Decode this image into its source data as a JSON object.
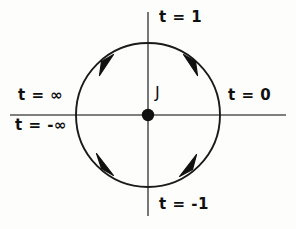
{
  "diagram": {
    "background_color": "#fdfdfc",
    "stroke_color": "#1a1a1a",
    "axis_color": "#555555",
    "center": {
      "x": 148,
      "y": 115
    },
    "radius": 72,
    "origin_label": "J",
    "labels": {
      "top": "t = 1",
      "bottom": "t = -1",
      "right": "t = 0",
      "left_upper": "t = ∞",
      "left_lower": "t = -∞"
    },
    "arrows": [
      {
        "name": "upper-left-arrow",
        "position": "upper-left",
        "direction": "toward-top"
      },
      {
        "name": "upper-right-arrow",
        "position": "upper-right",
        "direction": "toward-top"
      },
      {
        "name": "lower-left-arrow",
        "position": "lower-left",
        "direction": "toward-left"
      },
      {
        "name": "lower-right-arrow",
        "position": "lower-right",
        "direction": "toward-bottom"
      }
    ],
    "axes": {
      "horizontal": {
        "x1": 10,
        "x2": 286,
        "y": 115
      },
      "vertical": {
        "y1": 12,
        "y2": 216,
        "x": 148
      }
    }
  }
}
